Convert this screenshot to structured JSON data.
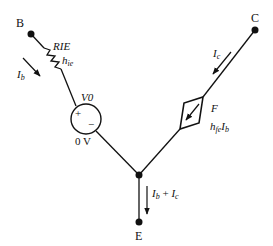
{
  "nodes": {
    "B": "B",
    "C": "C",
    "E": "E"
  },
  "resistor": {
    "name": "RIE",
    "param": "h",
    "param_sub": "ie"
  },
  "voltage_source": {
    "name": "V0",
    "value": "0 V",
    "plus": "+",
    "minus": "−"
  },
  "dependent_source": {
    "name": "F",
    "expr_h": "h",
    "expr_sub": "fe",
    "expr_I": "I",
    "expr_I_sub": "b"
  },
  "currents": {
    "base": {
      "sym": "I",
      "sub": "b"
    },
    "collector": {
      "sym": "I",
      "sub": "c"
    },
    "emitter": {
      "sym1": "I",
      "sub1": "b",
      "plus": " + ",
      "sym2": "I",
      "sub2": "c"
    }
  },
  "colors": {
    "stroke": "#111111",
    "background": "#ffffff"
  }
}
